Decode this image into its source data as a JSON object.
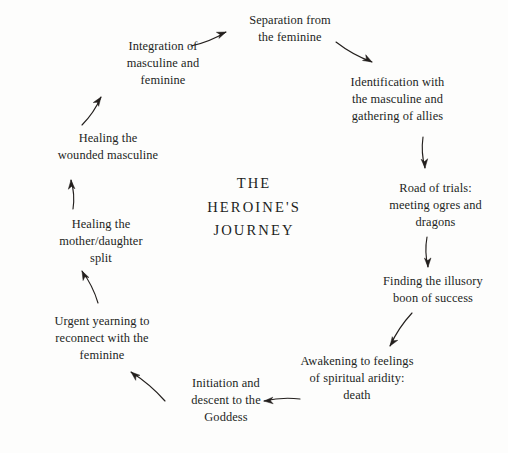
{
  "figure": {
    "center_title": "THE\nHEROINE'S\nJOURNEY",
    "background_color": "#fdfdfc",
    "text_color": "#231f1d",
    "arrow_color": "#231f1d"
  },
  "stages": [
    {
      "id": "separation-from-the-feminine",
      "label": "Separation from\nthe feminine",
      "x": 225,
      "y": 12,
      "w": 130
    },
    {
      "id": "identification-with-the-masculine",
      "label": "Identification with\nthe masculine and\ngathering of allies",
      "x": 330,
      "y": 74,
      "w": 135
    },
    {
      "id": "road-of-trials",
      "label": "Road of trials:\nmeeting ogres and\ndragons",
      "x": 368,
      "y": 180,
      "w": 135
    },
    {
      "id": "finding-the-illusory-boon",
      "label": "Finding the illusory\nboon of success",
      "x": 362,
      "y": 273,
      "w": 142
    },
    {
      "id": "awakening-to-spiritual-aridity",
      "label": "Awakening to feelings\nof spiritual aridity:\ndeath",
      "x": 282,
      "y": 353,
      "w": 150
    },
    {
      "id": "initiation-and-descent",
      "label": "Initiation and\ndescent to the\nGoddess",
      "x": 166,
      "y": 375,
      "w": 120
    },
    {
      "id": "urgent-yearning-to-reconnect",
      "label": "Urgent yearning to\nreconnect with the\nfeminine",
      "x": 32,
      "y": 313,
      "w": 140
    },
    {
      "id": "healing-the-mother-daughter-split",
      "label": "Healing the\nmother/daughter\nsplit",
      "x": 36,
      "y": 216,
      "w": 130
    },
    {
      "id": "healing-the-wounded-masculine",
      "label": "Healing the\nwounded masculine",
      "x": 38,
      "y": 130,
      "w": 140
    },
    {
      "id": "integration-of-masculine-and-feminine",
      "label": "Integration of\nmasculine and\nfeminine",
      "x": 100,
      "y": 38,
      "w": 126
    }
  ],
  "arrows": [
    {
      "id": "arrow-integration-to-separation",
      "x1": 191,
      "y1": 46,
      "x2": 226,
      "y2": 32
    },
    {
      "id": "arrow-separation-to-identification",
      "x1": 336,
      "y1": 42,
      "x2": 372,
      "y2": 62
    },
    {
      "id": "arrow-identification-to-road",
      "x1": 423,
      "y1": 137,
      "x2": 425,
      "y2": 168
    },
    {
      "id": "arrow-road-to-finding",
      "x1": 427,
      "y1": 237,
      "x2": 428,
      "y2": 267
    },
    {
      "id": "arrow-finding-to-awakening",
      "x1": 412,
      "y1": 313,
      "x2": 390,
      "y2": 346
    },
    {
      "id": "arrow-awakening-to-initiation",
      "x1": 300,
      "y1": 399,
      "x2": 264,
      "y2": 401
    },
    {
      "id": "arrow-initiation-to-urgent",
      "x1": 165,
      "y1": 401,
      "x2": 131,
      "y2": 372
    },
    {
      "id": "arrow-urgent-to-healing-split",
      "x1": 98,
      "y1": 303,
      "x2": 82,
      "y2": 271
    },
    {
      "id": "arrow-healing-split-to-healing-masculine",
      "x1": 73,
      "y1": 209,
      "x2": 71,
      "y2": 180
    },
    {
      "id": "arrow-healing-masculine-to-integration",
      "x1": 82,
      "y1": 125,
      "x2": 101,
      "y2": 97
    }
  ]
}
